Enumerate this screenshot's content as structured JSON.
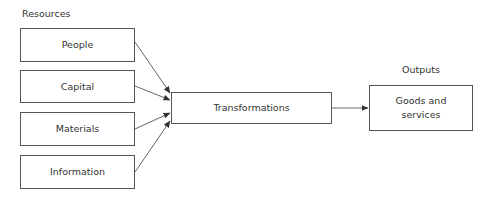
{
  "diagram": {
    "headings": {
      "resources": "Resources",
      "outputs": "Outputs"
    },
    "resources": [
      {
        "label": "People"
      },
      {
        "label": "Capital"
      },
      {
        "label": "Materials"
      },
      {
        "label": "Information"
      }
    ],
    "process": {
      "label": "Transformations"
    },
    "output": {
      "label_line1": "Goods and",
      "label_line2": "services"
    },
    "edges": [
      {
        "from": "People",
        "to": "Transformations"
      },
      {
        "from": "Capital",
        "to": "Transformations"
      },
      {
        "from": "Materials",
        "to": "Transformations"
      },
      {
        "from": "Information",
        "to": "Transformations"
      },
      {
        "from": "Transformations",
        "to": "Goods and services"
      }
    ],
    "colors": {
      "stroke": "#555555",
      "text": "#333333",
      "background": "#ffffff"
    }
  }
}
